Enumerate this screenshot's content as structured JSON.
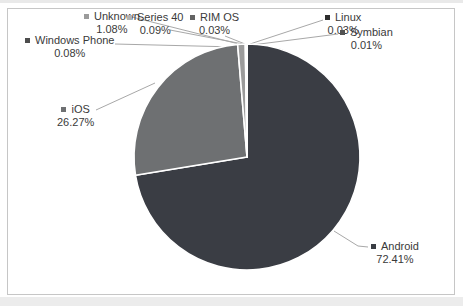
{
  "chart_data": {
    "type": "pie",
    "title": "",
    "unit": "%",
    "start_angle_deg": 0,
    "direction": "clockwise",
    "legend_position": "none",
    "data_labels": "outside-with-leader-lines",
    "slices": [
      {
        "label": "Android",
        "value": 72.41,
        "value_label": "72.41%",
        "color": "#3a3d44"
      },
      {
        "label": "iOS",
        "value": 26.27,
        "value_label": "26.27%",
        "color": "#6e7072"
      },
      {
        "label": "Unknown",
        "value": 1.08,
        "value_label": "1.08%",
        "color": "#9b9b9b"
      },
      {
        "label": "Windows Phone",
        "value": 0.08,
        "value_label": "0.08%",
        "color": "#4d4d4d"
      },
      {
        "label": "Series 40",
        "value": 0.09,
        "value_label": "0.09%",
        "color": "#b3b3b3"
      },
      {
        "label": "RIM OS",
        "value": 0.03,
        "value_label": "0.03%",
        "color": "#636363"
      },
      {
        "label": "Linux",
        "value": 0.03,
        "value_label": "0.03%",
        "color": "#2e2e2e"
      },
      {
        "label": "Symbian",
        "value": 0.01,
        "value_label": "0.01%",
        "color": "#525252"
      }
    ]
  },
  "layout": {
    "pie": {
      "cx": 247,
      "cy": 157,
      "r": 113,
      "stroke": "#ffffff",
      "stroke_width": 1.6
    },
    "leader_color": "#a8a8a8",
    "text_color": "#3a3a3a",
    "frame_border_color": "#c6c6c6",
    "labels": {
      "android": {
        "x": 371,
        "y": 240,
        "leader": [
          [
            334,
            231
          ],
          [
            358,
            246
          ],
          [
            368,
            247
          ]
        ]
      },
      "ios": {
        "x": 57,
        "y": 103,
        "leader": [
          [
            96,
            110
          ],
          [
            155,
            83
          ]
        ]
      },
      "unknown": {
        "x": 84,
        "y": 10,
        "leader": [
          [
            132,
            17
          ],
          [
            239,
            44
          ]
        ]
      },
      "windows-phone": {
        "x": 25,
        "y": 34,
        "leader": [
          [
            115,
            44
          ],
          [
            236,
            47
          ]
        ]
      },
      "series-40": {
        "x": 127,
        "y": 11,
        "leader": [
          [
            170,
            30
          ],
          [
            243,
            44
          ]
        ]
      },
      "rim-os": {
        "x": 190,
        "y": 11,
        "leader": [
          [
            225,
            36
          ],
          [
            245,
            44
          ]
        ]
      },
      "linux": {
        "x": 325,
        "y": 11,
        "leader": [
          [
            323,
            20
          ],
          [
            250,
            44
          ]
        ]
      },
      "symbian": {
        "x": 340,
        "y": 26,
        "leader": [
          [
            338,
            34
          ],
          [
            252,
            45
          ]
        ]
      }
    }
  }
}
